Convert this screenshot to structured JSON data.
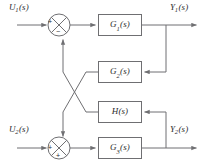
{
  "diagram": {
    "type": "control-system-block-diagram",
    "width": 208,
    "height": 165,
    "line_color": "#6f6f72",
    "text_color": "#2b2b2e",
    "background": "#ffffff",
    "signals": {
      "input_1": {
        "base": "U",
        "sub": "1",
        "paren": "(s)",
        "full": "U1(s)"
      },
      "input_2": {
        "base": "U",
        "sub": "2",
        "paren": "(s)",
        "full": "U2(s)"
      },
      "output_1": {
        "base": "Y",
        "sub": "1",
        "paren": "(s)",
        "full": "Y1(s)"
      },
      "output_2": {
        "base": "Y",
        "sub": "2",
        "paren": "(s)",
        "full": "Y2(s)"
      }
    },
    "blocks": [
      {
        "id": "g1",
        "base": "G",
        "sub": "1",
        "paren": "(s)",
        "full": "G1(s)",
        "x": 98,
        "y": 14,
        "w": 44,
        "h": 22
      },
      {
        "id": "g2",
        "base": "G",
        "sub": "2",
        "paren": "(s)",
        "full": "G2(s)",
        "x": 98,
        "y": 61,
        "w": 44,
        "h": 22
      },
      {
        "id": "h",
        "base": "H",
        "sub": "",
        "paren": "(s)",
        "full": "H(s)",
        "x": 98,
        "y": 101,
        "w": 44,
        "h": 22
      },
      {
        "id": "g3",
        "base": "G",
        "sub": "3",
        "paren": "(s)",
        "full": "G3(s)",
        "x": 98,
        "y": 137,
        "w": 44,
        "h": 22
      }
    ],
    "summing_junctions": [
      {
        "id": "sum1",
        "cx": 59,
        "cy": 25,
        "r": 11,
        "signs": [
          {
            "label": "+",
            "position": "left",
            "x": 48,
            "y": 20
          },
          {
            "label": "−",
            "position": "bottom",
            "x": 56,
            "y": 29
          }
        ]
      },
      {
        "id": "sum2",
        "cx": 59,
        "cy": 148,
        "r": 11,
        "signs": [
          {
            "label": "+",
            "position": "left",
            "x": 48,
            "y": 143
          },
          {
            "label": "+",
            "position": "bottom",
            "x": 56,
            "y": 151
          }
        ]
      }
    ],
    "labels": {
      "u1": {
        "x": 9,
        "y": 2
      },
      "y1": {
        "x": 170,
        "y": 2
      },
      "u2": {
        "x": 9,
        "y": 124
      },
      "y2": {
        "x": 170,
        "y": 124
      }
    }
  }
}
